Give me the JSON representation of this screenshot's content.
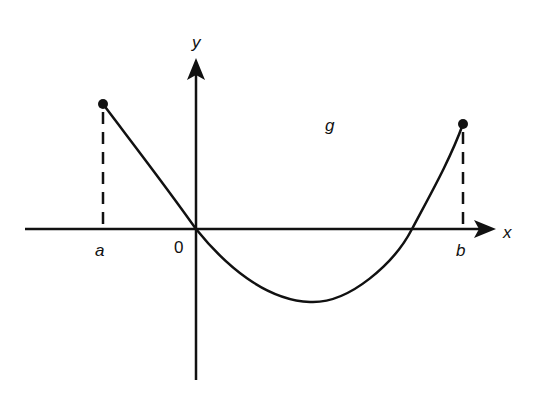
{
  "diagram": {
    "axes": {
      "x_label": "x",
      "y_label": "y",
      "origin_label": "0"
    },
    "function_label": "g",
    "endpoints": {
      "left_label": "a",
      "right_label": "b"
    }
  },
  "colors": {
    "ink": "#111111",
    "background": "#ffffff"
  }
}
